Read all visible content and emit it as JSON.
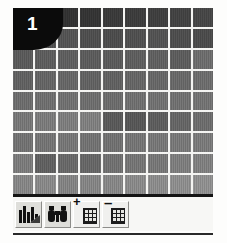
{
  "badge": {
    "number": "1",
    "color": "#0b0b0b",
    "text_color": "#ffffff"
  },
  "grid": {
    "columns": 9,
    "rows": 9,
    "gridline_color": "#f4f4f2",
    "description": "9 by 9 matrix of vertically-striped gray tiles, shading from dark at the top to lighter at the bottom",
    "cells": [
      [
        "#3b3b3b",
        "#363636",
        "#313131",
        "#343434",
        "#393939",
        "#3b3b3b",
        "#3e3e3e",
        "#414141",
        "#454545"
      ],
      [
        "#4a4a4a",
        "#4f4f4f",
        "#525252",
        "#4d4d4d",
        "#4b4b4b",
        "#4e4e4e",
        "#515151",
        "#4c4c4c",
        "#4a4a4a"
      ],
      [
        "#585858",
        "#5b5b5b",
        "#5d5d5d",
        "#5a5a5a",
        "#595959",
        "#5c5c5c",
        "#5e5e5e",
        "#5b5b5b",
        "#6a6a6a"
      ],
      [
        "#5f5f5f",
        "#626262",
        "#646464",
        "#606060",
        "#5f5f5f",
        "#636363",
        "#656565",
        "#666666",
        "#6a6a6a"
      ],
      [
        "#6a6a6a",
        "#6c6c6c",
        "#6e6e6e",
        "#6b6b6b",
        "#696969",
        "#6d6d6d",
        "#6f6f6f",
        "#6e6e6e",
        "#707070"
      ],
      [
        "#747474",
        "#787878",
        "#7a7a7a",
        "#7c7c7c",
        "#575757",
        "#555555",
        "#5b5b5b",
        "#636363",
        "#6a6a6a"
      ],
      [
        "#6f6f6f",
        "#717171",
        "#737373",
        "#707070",
        "#6e6e6e",
        "#727272",
        "#747474",
        "#757575",
        "#777777"
      ],
      [
        "#787878",
        "#5e5e5e",
        "#666666",
        "#646464",
        "#6e6e6e",
        "#727272",
        "#747474",
        "#7a7a7a",
        "#7c7c7c"
      ],
      [
        "#828282",
        "#858585",
        "#7f7f7f",
        "#818181",
        "#838383",
        "#868686",
        "#888888",
        "#8a8a8a",
        "#8c8c8c"
      ]
    ]
  },
  "toolbar": {
    "background": "#f7f7f5",
    "buttons": [
      {
        "name": "bar-chart-icon",
        "label": ""
      },
      {
        "name": "binoculars-icon",
        "label": ""
      },
      {
        "name": "grid-plus-icon",
        "label": "+"
      },
      {
        "name": "grid-minus-icon",
        "label": "–"
      }
    ]
  },
  "rules": {
    "top_color": "#141414",
    "bottom_color": "#2a2a2a"
  }
}
